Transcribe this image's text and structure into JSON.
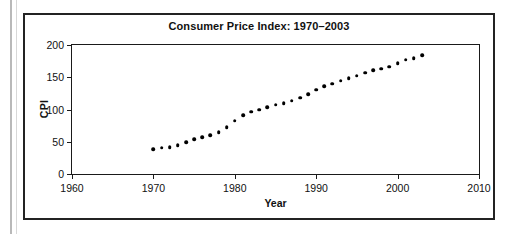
{
  "figure": {
    "title": "Consumer Price Index: 1970–2003",
    "y_axis_title": "CPI",
    "x_axis_title": "Year"
  },
  "chart_data": {
    "type": "scatter",
    "title": "Consumer Price Index: 1970–2003",
    "xlabel": "Year",
    "ylabel": "CPI",
    "xlim": [
      1960,
      2010
    ],
    "ylim": [
      0,
      200
    ],
    "xticks": [
      1960,
      1970,
      1980,
      1990,
      2000,
      2010
    ],
    "yticks": [
      0,
      50,
      100,
      150,
      200
    ],
    "grid": false,
    "legend": null,
    "marker": "filled-circle",
    "marker_color": "#000000",
    "x": [
      1970,
      1971,
      1972,
      1973,
      1974,
      1975,
      1976,
      1977,
      1978,
      1979,
      1980,
      1981,
      1982,
      1983,
      1984,
      1985,
      1986,
      1987,
      1988,
      1989,
      1990,
      1991,
      1992,
      1993,
      1994,
      1995,
      1996,
      1997,
      1998,
      1999,
      2000,
      2001,
      2002,
      2003
    ],
    "values": [
      38.8,
      40.5,
      41.8,
      44.4,
      49.3,
      53.8,
      56.9,
      60.6,
      65.2,
      72.6,
      82.4,
      90.9,
      96.5,
      99.6,
      103.9,
      107.6,
      109.6,
      113.6,
      118.3,
      124.0,
      130.7,
      136.2,
      140.3,
      144.5,
      148.2,
      152.4,
      156.9,
      160.5,
      163.0,
      166.6,
      172.2,
      177.1,
      179.9,
      184.0
    ]
  }
}
